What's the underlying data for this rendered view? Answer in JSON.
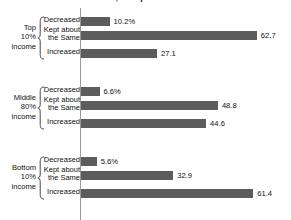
{
  "chart": {
    "title": "decreased, or kept about the same?",
    "axis_color": "#9a9a9a",
    "bar_color": "#5c5c5c"
  },
  "chart_data": {
    "type": "bar",
    "title": "decreased, or kept about the same?",
    "xlabel": "",
    "ylabel": "",
    "orientation": "horizontal",
    "xlim": [
      0,
      70
    ],
    "grid": false,
    "legend": "none",
    "categories": [
      "Decreased",
      "Kept about the Same",
      "Increased"
    ],
    "groups": [
      {
        "name": "Top 10% income",
        "name_lines": [
          "Top",
          "10%",
          "income"
        ],
        "points": [
          {
            "label": "Decreased",
            "value": 10.2,
            "display": "10.2%"
          },
          {
            "label": "Kept about\nthe Same",
            "value": 62.7,
            "display": "62.7"
          },
          {
            "label": "Increased",
            "value": 27.1,
            "display": "27.1"
          }
        ]
      },
      {
        "name": "Middle 80% income",
        "name_lines": [
          "Middle",
          "80%",
          "income"
        ],
        "points": [
          {
            "label": "Decreased",
            "value": 6.6,
            "display": "6.6%"
          },
          {
            "label": "Kept about\nthe Same",
            "value": 48.8,
            "display": "48.8"
          },
          {
            "label": "Increased",
            "value": 44.6,
            "display": "44.6"
          }
        ]
      },
      {
        "name": "Bottom 10% income",
        "name_lines": [
          "Bottom",
          "10%",
          "income"
        ],
        "points": [
          {
            "label": "Decreased",
            "value": 5.6,
            "display": "5.6%"
          },
          {
            "label": "Kept about\nthe Same",
            "value": 32.9,
            "display": "32.9"
          },
          {
            "label": "Increased",
            "value": 61.4,
            "display": "61.4"
          }
        ]
      }
    ]
  }
}
